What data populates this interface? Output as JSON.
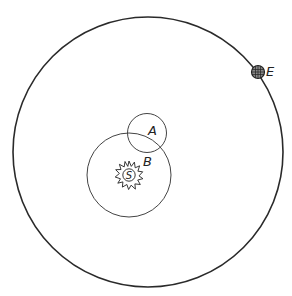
{
  "diagram": {
    "type": "orbital-diagram",
    "colors": {
      "stroke": "#2a2a2a",
      "background": "#ffffff"
    },
    "orbits": [
      {
        "name": "earth-orbit",
        "cx": 148,
        "cy": 152,
        "r": 135
      },
      {
        "name": "orbit-b",
        "cx": 129,
        "cy": 175,
        "r": 42
      },
      {
        "name": "orbit-a",
        "cx": 147,
        "cy": 133,
        "r": 19.5
      }
    ],
    "bodies": {
      "sun": {
        "label": "S",
        "cx": 129,
        "cy": 175
      },
      "earth": {
        "label": "E",
        "cx": 258,
        "cy": 72
      }
    },
    "labels": {
      "a": "A",
      "b": "B",
      "e": "E",
      "s": "S"
    }
  }
}
